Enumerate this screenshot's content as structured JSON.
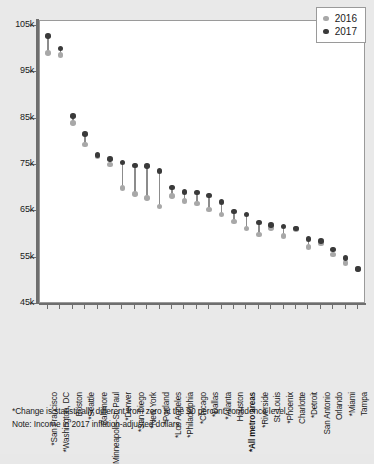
{
  "legend": {
    "position": "top-right",
    "entries": [
      {
        "label": "2016",
        "color": "#a8a8a8",
        "icon": "dot-icon"
      },
      {
        "label": "2017",
        "color": "#3a3a3a",
        "icon": "dot-icon"
      }
    ]
  },
  "footnotes": {
    "significance": "*Change is statistically different from zero at the 90 percent confidence level.",
    "note": "Note: Income in 2017 inflation-adjusted dollars."
  },
  "axis": {
    "y_ticks": [
      "45k",
      "55k",
      "65k",
      "75k",
      "85k",
      "95k",
      "105k"
    ],
    "y_min": 45000,
    "y_max": 105000,
    "y_step": 10000
  },
  "chart_data": {
    "type": "scatter",
    "title": "",
    "subtitle": "",
    "xlabel": "",
    "ylabel": "",
    "ylim": [
      45000,
      105000
    ],
    "ytick_labels": [
      "45k",
      "55k",
      "65k",
      "75k",
      "85k",
      "95k",
      "105k"
    ],
    "grid": false,
    "legend_position": "top-right",
    "marker_style": "paired-dumbbell",
    "categories": [
      "*San Francisco",
      "*Washington, DC",
      "Boston",
      "*Seattle",
      "Baltimore",
      "Minneapolis-St. Paul",
      "*Denver",
      "*San Diego",
      "*New York",
      "*Portland",
      "*Los Angeles",
      "*Philadelphia",
      "*Chicago",
      "*Dallas",
      "*Atlanta",
      "Houston",
      "*All metro areas",
      "*Riverside",
      "St. Louis",
      "*Phoenix",
      "Charlotte",
      "*Detroit",
      "San Antonio",
      "Orlando",
      "*Miami",
      "Tampa"
    ],
    "bold_categories": [
      "*All metro areas"
    ],
    "series": [
      {
        "name": "2016",
        "color": "#a8a8a8",
        "values": [
          99200,
          98700,
          84100,
          79400,
          76800,
          75100,
          70000,
          68800,
          67900,
          66000,
          68300,
          67200,
          66700,
          65400,
          64300,
          62800,
          61300,
          60000,
          61400,
          59700,
          61200,
          57300,
          58100,
          55700,
          53800,
          52600
        ]
      },
      {
        "name": "2017",
        "color": "#3a3a3a",
        "values": [
          102800,
          100100,
          85600,
          81700,
          77200,
          76300,
          75500,
          74900,
          74800,
          73700,
          70100,
          69200,
          69100,
          68400,
          67000,
          65000,
          64300,
          62600,
          62000,
          61700,
          61300,
          59000,
          58600,
          56800,
          54900,
          52500
        ]
      }
    ]
  }
}
